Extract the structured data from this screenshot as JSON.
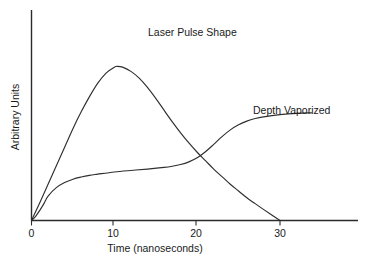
{
  "chart_data": {
    "type": "line",
    "title": "",
    "xlabel": "Time (nanoseconds)",
    "ylabel": "Arbitrary Units",
    "xlim": [
      0,
      39
    ],
    "ylim": [
      0,
      1.1
    ],
    "xticks": [
      0,
      10,
      20,
      30
    ],
    "xticklabels": [
      "0",
      "10",
      "20",
      "30"
    ],
    "yticks": [],
    "yticklabels": [],
    "grid": false,
    "legend_position": "inline-annotations",
    "annotations": [
      {
        "text": "Laser Pulse Shape",
        "x": 14.0,
        "y": 0.99
      },
      {
        "text": "Depth Vaporized",
        "x": 27.5,
        "y": 0.62
      }
    ],
    "series": [
      {
        "name": "Laser Pulse Shape",
        "x": [
          0,
          1,
          2,
          3,
          4,
          5,
          6,
          7,
          8,
          9,
          10,
          10.4,
          11,
          12,
          13,
          14,
          15,
          16,
          17,
          18,
          19,
          20,
          21,
          22,
          23,
          24,
          25,
          26,
          27,
          28,
          29,
          30
        ],
        "y": [
          0.0,
          0.105,
          0.215,
          0.325,
          0.435,
          0.545,
          0.645,
          0.735,
          0.815,
          0.875,
          0.91,
          0.915,
          0.91,
          0.885,
          0.845,
          0.79,
          0.725,
          0.655,
          0.585,
          0.52,
          0.46,
          0.405,
          0.355,
          0.305,
          0.26,
          0.215,
          0.175,
          0.135,
          0.1,
          0.066,
          0.033,
          0.0
        ]
      },
      {
        "name": "Depth Vaporized",
        "x": [
          0,
          0.5,
          1,
          1.5,
          2,
          3,
          4,
          5,
          6,
          7,
          8,
          10,
          12,
          14,
          16,
          17,
          18,
          19,
          20,
          21,
          22,
          23,
          24,
          25,
          26,
          27,
          28,
          30,
          32,
          33.8
        ],
        "y": [
          0.0,
          0.025,
          0.06,
          0.1,
          0.145,
          0.195,
          0.225,
          0.245,
          0.258,
          0.268,
          0.275,
          0.288,
          0.297,
          0.305,
          0.315,
          0.322,
          0.332,
          0.348,
          0.372,
          0.408,
          0.452,
          0.498,
          0.538,
          0.568,
          0.59,
          0.605,
          0.615,
          0.628,
          0.636,
          0.639
        ]
      }
    ]
  },
  "axis": {
    "origin_label": "0",
    "x_axis_title": "Time (nanoseconds)",
    "y_axis_title": "Arbitrary Units"
  }
}
